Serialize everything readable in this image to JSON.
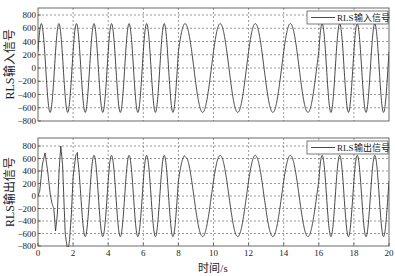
{
  "figure": {
    "xlabel": "时间/s",
    "colors": {
      "line": "#333333",
      "grid": "#555555",
      "frame": "#444444",
      "background": "#ffffff"
    }
  },
  "chart_data": [
    {
      "type": "line",
      "title": "",
      "legend": [
        "RLS输入信号"
      ],
      "legend_position": "upper right",
      "ylabel": "RLS输入信号",
      "xlabel": "",
      "xlim": [
        0,
        20
      ],
      "ylim": [
        -800,
        800
      ],
      "xticks": [
        0,
        2,
        4,
        6,
        8,
        10,
        12,
        14,
        16,
        18,
        20
      ],
      "yticks": [
        -800,
        -600,
        -400,
        -200,
        0,
        200,
        400,
        600,
        800
      ],
      "ytick_labels": [
        "−800",
        "−600",
        "−400",
        "−200",
        "0",
        "200",
        "400",
        "600",
        "800"
      ],
      "grid": true,
      "series": [
        {
          "name": "RLS输入信号",
          "amplitude": 670,
          "segments": [
            {
              "t_start": 0,
              "t_end": 8.0,
              "frequency_hz": 1.0
            },
            {
              "t_start": 8.0,
              "t_end": 16.0,
              "frequency_hz": 0.5
            },
            {
              "t_start": 16.0,
              "t_end": 20.0,
              "frequency_hz": 1.0
            }
          ],
          "peak_value": 670,
          "trough_value": -670
        }
      ]
    },
    {
      "type": "line",
      "title": "",
      "legend": [
        "RLS输出信号"
      ],
      "legend_position": "upper right",
      "ylabel": "RLS输出信号",
      "xlabel": "时间/s",
      "xlim": [
        0,
        20
      ],
      "ylim": [
        -800,
        800
      ],
      "xticks": [
        0,
        2,
        4,
        6,
        8,
        10,
        12,
        14,
        16,
        18,
        20
      ],
      "xtick_labels": [
        "0",
        "2",
        "4",
        "6",
        "8",
        "10",
        "12",
        "14",
        "16",
        "18",
        "20"
      ],
      "yticks": [
        -800,
        -600,
        -400,
        -200,
        0,
        200,
        400,
        600,
        800
      ],
      "ytick_labels": [
        "−800",
        "−600",
        "−400",
        "−200",
        "0",
        "200",
        "400",
        "600",
        "800"
      ],
      "grid": true,
      "series": [
        {
          "name": "RLS输出信号",
          "amplitude": 650,
          "segments": [
            {
              "t_start": 0,
              "t_end": 8.0,
              "frequency_hz": 1.0
            },
            {
              "t_start": 8.0,
              "t_end": 16.0,
              "frequency_hz": 0.5
            },
            {
              "t_start": 16.0,
              "t_end": 20.0,
              "frequency_hz": 1.0
            }
          ],
          "transient": [
            [
              0.0,
              0
            ],
            [
              0.1,
              80
            ],
            [
              0.25,
              500
            ],
            [
              0.4,
              690
            ],
            [
              0.55,
              400
            ],
            [
              0.7,
              20
            ],
            [
              0.8,
              -120
            ],
            [
              0.9,
              -200
            ],
            [
              1.0,
              -560
            ],
            [
              1.1,
              -300
            ],
            [
              1.2,
              400
            ],
            [
              1.3,
              800
            ],
            [
              1.4,
              500
            ],
            [
              1.55,
              -600
            ],
            [
              1.65,
              -800
            ],
            [
              1.7,
              -900
            ],
            [
              1.8,
              -700
            ],
            [
              1.9,
              -300
            ],
            [
              2.0,
              300
            ],
            [
              2.15,
              650
            ],
            [
              2.25,
              700
            ]
          ],
          "notes": "initial adaptive transient 0–2.3 s with overshoot to ~800 and ~-900; shoulder near 600→500 at ~8.5 s; stable tracking afterward",
          "peak_value": 650,
          "trough_value": -680
        }
      ]
    }
  ]
}
